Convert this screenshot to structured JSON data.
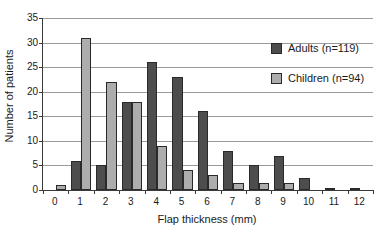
{
  "chart_data": {
    "type": "bar",
    "title": "",
    "subtitle": "",
    "xlabel": "Flap thickness (mm)",
    "ylabel": "Number of patients",
    "categories": [
      "0",
      "1",
      "2",
      "3",
      "4",
      "5",
      "6",
      "7",
      "8",
      "9",
      "10",
      "11",
      "12"
    ],
    "series": [
      {
        "name": "Adults (n=119)",
        "color": "#4d4d4d",
        "values": [
          0,
          6,
          5,
          18,
          26,
          23,
          16,
          8,
          5,
          7,
          2.5,
          0.5,
          0.5
        ]
      },
      {
        "name": "Children (n=94)",
        "color": "#adadad",
        "values": [
          1,
          31,
          22,
          18,
          9,
          4,
          3,
          1.5,
          1.5,
          1.5,
          0,
          0,
          0
        ]
      }
    ],
    "ylim": [
      0,
      35
    ],
    "yticks": [
      0,
      5,
      10,
      15,
      20,
      25,
      30,
      35
    ],
    "ytick_labels": [
      "0",
      "5",
      "10",
      "15",
      "20",
      "25",
      "30",
      "35"
    ],
    "grid": "horizontal",
    "legend_position": "top-right",
    "legend": [
      {
        "label": "Adults (n=119)",
        "swatch": "adults"
      },
      {
        "label": "Children (n=94)",
        "swatch": "children"
      }
    ]
  }
}
